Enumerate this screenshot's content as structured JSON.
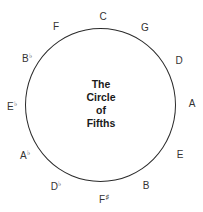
{
  "diagram": {
    "title_lines": [
      "The",
      "Circle",
      "of",
      "Fifths"
    ],
    "notes": [
      {
        "name": "C",
        "accidental": "",
        "x": 103,
        "y": 17
      },
      {
        "name": "G",
        "accidental": "",
        "x": 145,
        "y": 28
      },
      {
        "name": "D",
        "accidental": "",
        "x": 179,
        "y": 61
      },
      {
        "name": "A",
        "accidental": "",
        "x": 192,
        "y": 104
      },
      {
        "name": "E",
        "accidental": "",
        "x": 180,
        "y": 155
      },
      {
        "name": "B",
        "accidental": "",
        "x": 146,
        "y": 186
      },
      {
        "name": "F",
        "accidental": "♯",
        "x": 104,
        "y": 199
      },
      {
        "name": "D",
        "accidental": "♭",
        "x": 56,
        "y": 186
      },
      {
        "name": "A",
        "accidental": "♭",
        "x": 25,
        "y": 155
      },
      {
        "name": "E",
        "accidental": "♭",
        "x": 12,
        "y": 106
      },
      {
        "name": "B",
        "accidental": "♭",
        "x": 27,
        "y": 58
      },
      {
        "name": "F",
        "accidental": "",
        "x": 56,
        "y": 27
      }
    ],
    "colors": {
      "line": "#2a2a2a",
      "text": "#333333",
      "background": "#ffffff"
    }
  }
}
